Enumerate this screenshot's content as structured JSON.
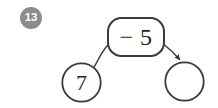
{
  "page": {
    "background_color": "#ffffff",
    "stroke_color": "#3a3a3a",
    "text_color": "#231f20"
  },
  "problem": {
    "number": "13",
    "badge_fill": "#8c8c8c",
    "badge_text_color": "#ffffff"
  },
  "diagram": {
    "type": "function-machine",
    "start_node": {
      "shape": "circle",
      "value": "7",
      "filled": false
    },
    "operation_node": {
      "shape": "rounded-rectangle",
      "value": "− 5",
      "operator": "−",
      "operand": "5"
    },
    "result_node": {
      "shape": "circle",
      "value": "",
      "filled": false,
      "is_answer_blank": true
    },
    "connectors": [
      {
        "from": "start_node",
        "to": "operation_node",
        "style": "curved",
        "arrowhead": false
      },
      {
        "from": "operation_node",
        "to": "result_node",
        "style": "curved",
        "arrowhead": true
      }
    ]
  }
}
